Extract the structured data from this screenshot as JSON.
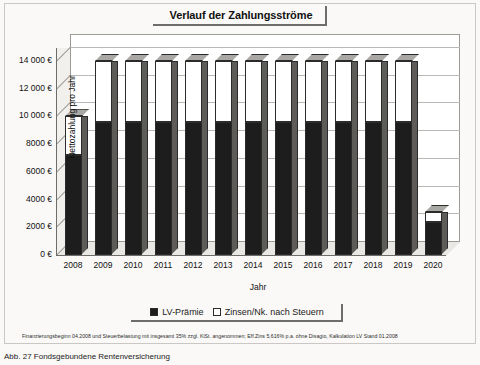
{
  "chart_data": {
    "type": "bar",
    "subtype": "stacked-bar-3d",
    "title": "Verlauf der Zahlungsströme",
    "xlabel": "Jahr",
    "ylabel": "Nettozahlung pro Jahr",
    "categories": [
      "2008",
      "2009",
      "2010",
      "2011",
      "2012",
      "2013",
      "2014",
      "2015",
      "2016",
      "2017",
      "2018",
      "2019",
      "2020"
    ],
    "series": [
      {
        "name": "LV-Prämie",
        "color": "#1d1d1d",
        "values": [
          7200,
          9600,
          9600,
          9600,
          9600,
          9600,
          9600,
          9600,
          9600,
          9600,
          9600,
          9600,
          2400
        ]
      },
      {
        "name": "Zinsen/Nk. nach Steuern",
        "color": "#ffffff",
        "values": [
          2800,
          4400,
          4400,
          4400,
          4400,
          4400,
          4400,
          4400,
          4400,
          4400,
          4400,
          4400,
          700
        ]
      }
    ],
    "totals": [
      10000,
      14000,
      14000,
      14000,
      14000,
      14000,
      14000,
      14000,
      14000,
      14000,
      14000,
      14000,
      3100
    ],
    "ylim": [
      0,
      15000
    ],
    "yticks": [
      0,
      2000,
      4000,
      6000,
      8000,
      10000,
      12000,
      14000
    ],
    "ytick_labels": [
      "0 €",
      "2000 €",
      "4000 €",
      "6000 €",
      "8000 €",
      "10 000 €",
      "12 000 €",
      "14 000 €"
    ],
    "grid": true,
    "legend_position": "bottom",
    "annotation": "Finanzierungsbeginn 04.2008 und Steuerbelastung mit insgesamt 35% zzgl. KiSt. angenommen; Eff.Zins 5,616% p.a. ohne Disagio, Kalkulation LV Stand 01.2008"
  },
  "legend": {
    "items": [
      {
        "label": "LV-Prämie",
        "swatch": "filled-square-icon"
      },
      {
        "label": "Zinsen/Nk. nach Steuern",
        "swatch": "empty-square-icon"
      }
    ]
  },
  "footnote": "Finanzierungsbeginn 04.2008 und Steuerbelastung mit insgesamt 35% zzgl. KiSt. angenommen; Eff.Zins 5,616% p.a. ohne Disagio, Kalkulation LV Stand 01.2008",
  "caption": "Abb. 27  Fondsgebundene Rentenversicherung"
}
